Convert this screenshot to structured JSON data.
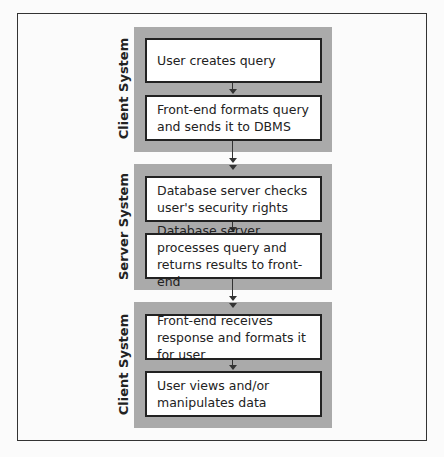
{
  "sections": [
    {
      "label": "Client System",
      "steps": [
        "User creates query",
        "Front-end formats query and sends it to DBMS"
      ]
    },
    {
      "label": "Server System",
      "steps": [
        "Database server checks user's security rights",
        "Database server processes query and returns results to front-end"
      ]
    },
    {
      "label": "Client System",
      "steps": [
        "Front-end receives response and formats it for user",
        "User views and/or manipulates data"
      ]
    }
  ]
}
